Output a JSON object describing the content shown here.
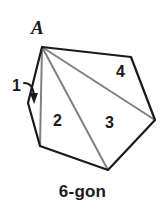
{
  "figure": {
    "caption": "6-gon",
    "vertex_label": "A",
    "region_labels": {
      "one": "1",
      "two": "2",
      "three": "3",
      "four": "4"
    },
    "colors": {
      "outline": "#1a1a1a",
      "diagonal": "#808080",
      "background": "#ffffff",
      "text": "#1a1a1a"
    },
    "geometry": {
      "type": "polygon-triangulation",
      "polygon_sides": 6,
      "vertices": [
        {
          "name": "A",
          "x": 42,
          "y": 47
        },
        {
          "name": "B",
          "x": 131,
          "y": 57
        },
        {
          "name": "C",
          "x": 155,
          "y": 120
        },
        {
          "name": "D",
          "x": 108,
          "y": 170
        },
        {
          "name": "E",
          "x": 40,
          "y": 146
        },
        {
          "name": "F",
          "x": 28,
          "y": 103
        }
      ],
      "diagonals": [
        {
          "from": "A",
          "to": "E"
        },
        {
          "from": "A",
          "to": "D"
        },
        {
          "from": "A",
          "to": "C"
        }
      ],
      "triangles": [
        {
          "label": "1",
          "vertices": [
            "A",
            "F",
            "E"
          ]
        },
        {
          "label": "2",
          "vertices": [
            "A",
            "E",
            "D"
          ]
        },
        {
          "label": "3",
          "vertices": [
            "A",
            "D",
            "C"
          ]
        },
        {
          "label": "4",
          "vertices": [
            "A",
            "C",
            "B"
          ]
        }
      ],
      "arrow": {
        "points_to": "1",
        "from_x": 24,
        "from_y": 84,
        "to_x": 35,
        "to_y": 103
      }
    }
  }
}
